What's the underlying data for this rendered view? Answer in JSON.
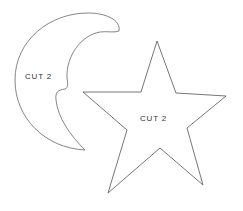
{
  "shapes": [
    {
      "name": "crescent-moon",
      "label": "CUT 2"
    },
    {
      "name": "star",
      "label": "CUT 2"
    }
  ],
  "colors": {
    "stroke": "#777777",
    "text": "#333333",
    "background": "#ffffff"
  }
}
